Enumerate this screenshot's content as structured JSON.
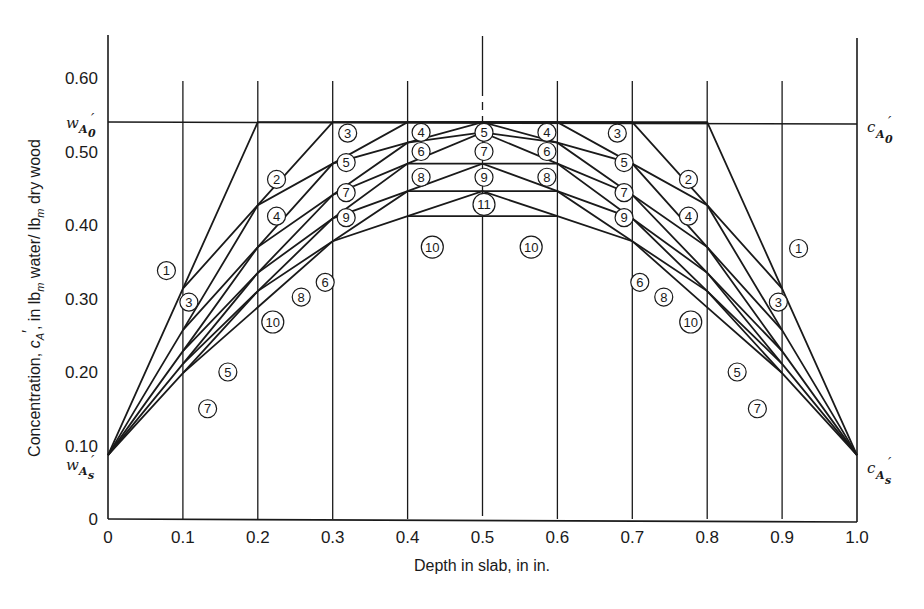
{
  "chart_data": {
    "type": "line",
    "title": "",
    "xlabel": "Depth in slab, in in.",
    "ylabel": "Concentration, c_A', in lb_m water/ lb_m dry wood",
    "xlim": [
      0,
      1.0
    ],
    "ylim": [
      0,
      0.65
    ],
    "x_ticks": [
      "0",
      "0.1",
      "0.2",
      "0.3",
      "0.4",
      "0.5",
      "0.6",
      "0.7",
      "0.8",
      "0.9",
      "1.0"
    ],
    "y_ticks": [
      "0",
      "0.10",
      "0.20",
      "0.30",
      "0.40",
      "0.50",
      "0.60"
    ],
    "grid": "vertical lines at each 0.1 in.",
    "initial_concentration": 0.54,
    "surface_concentration": 0.087,
    "annotations": {
      "left_top": "w_A0'",
      "left_bottom": "w_As'",
      "right_top": "c_A0'",
      "right_bottom": "c_As'"
    },
    "series": [
      {
        "name": "1",
        "x": [
          0,
          0.1,
          0.2,
          0.8,
          0.9,
          1.0
        ],
        "values": [
          0.087,
          0.3135,
          0.54,
          0.54,
          0.3135,
          0.087
        ]
      },
      {
        "name": "2",
        "x": [
          0.1,
          0.2,
          0.3,
          0.7,
          0.8,
          0.9
        ],
        "values": [
          0.3135,
          0.427,
          0.54,
          0.54,
          0.427,
          0.3135
        ]
      },
      {
        "name": "3",
        "x": [
          0,
          0.1,
          0.2,
          0.3,
          0.4,
          0.6,
          0.7,
          0.8,
          0.9,
          1.0
        ],
        "values": [
          0.087,
          0.257,
          0.427,
          0.4835,
          0.54,
          0.54,
          0.4835,
          0.427,
          0.257,
          0.087
        ]
      },
      {
        "name": "4",
        "x": [
          0.1,
          0.2,
          0.3,
          0.4,
          0.5,
          0.6,
          0.7,
          0.8,
          0.9
        ],
        "values": [
          0.257,
          0.37,
          0.4835,
          0.512,
          0.54,
          0.512,
          0.4835,
          0.37,
          0.257
        ]
      },
      {
        "name": "5",
        "x": [
          0,
          0.1,
          0.2,
          0.3,
          0.4,
          0.5,
          0.6,
          0.7,
          0.8,
          0.9,
          1.0
        ],
        "values": [
          0.087,
          0.2285,
          0.37,
          0.441,
          0.512,
          0.526,
          0.512,
          0.441,
          0.37,
          0.2285,
          0.087
        ]
      },
      {
        "name": "6",
        "x": [
          0.1,
          0.2,
          0.3,
          0.4,
          0.5,
          0.6,
          0.7,
          0.8,
          0.9
        ],
        "values": [
          0.2285,
          0.335,
          0.441,
          0.4835,
          0.526,
          0.4835,
          0.441,
          0.335,
          0.2285
        ]
      },
      {
        "name": "7",
        "x": [
          0,
          0.1,
          0.2,
          0.3,
          0.4,
          0.5,
          0.6,
          0.7,
          0.8,
          0.9,
          1.0
        ],
        "values": [
          0.087,
          0.211,
          0.335,
          0.409,
          0.4835,
          0.4835,
          0.4835,
          0.409,
          0.335,
          0.211,
          0.087
        ]
      },
      {
        "name": "8",
        "x": [
          0.1,
          0.2,
          0.3,
          0.4,
          0.5,
          0.6,
          0.7,
          0.8,
          0.9
        ],
        "values": [
          0.211,
          0.31,
          0.409,
          0.446,
          0.4835,
          0.446,
          0.409,
          0.31,
          0.211
        ]
      },
      {
        "name": "9",
        "x": [
          0,
          0.1,
          0.2,
          0.3,
          0.4,
          0.5,
          0.6,
          0.7,
          0.8,
          0.9,
          1.0
        ],
        "values": [
          0.087,
          0.1985,
          0.31,
          0.378,
          0.446,
          0.446,
          0.446,
          0.378,
          0.31,
          0.1985,
          0.087
        ]
      },
      {
        "name": "10",
        "x": [
          0.1,
          0.2,
          0.3,
          0.4,
          0.5,
          0.6,
          0.7,
          0.8,
          0.9
        ],
        "values": [
          0.1985,
          0.288,
          0.378,
          0.412,
          0.446,
          0.412,
          0.378,
          0.288,
          0.1985
        ]
      },
      {
        "name": "11",
        "x": [
          0.4,
          0.5,
          0.6
        ],
        "values": [
          0.412,
          0.412,
          0.412
        ]
      }
    ]
  },
  "labels": [
    {
      "text": "1",
      "x": 0.078,
      "y": 0.338
    },
    {
      "text": "1",
      "x": 0.922,
      "y": 0.368
    },
    {
      "text": "2",
      "x": 0.225,
      "y": 0.462
    },
    {
      "text": "2",
      "x": 0.775,
      "y": 0.462
    },
    {
      "text": "3",
      "x": 0.108,
      "y": 0.295
    },
    {
      "text": "3",
      "x": 0.32,
      "y": 0.525
    },
    {
      "text": "3",
      "x": 0.68,
      "y": 0.525
    },
    {
      "text": "3",
      "x": 0.895,
      "y": 0.295
    },
    {
      "text": "4",
      "x": 0.225,
      "y": 0.412
    },
    {
      "text": "4",
      "x": 0.418,
      "y": 0.526
    },
    {
      "text": "4",
      "x": 0.586,
      "y": 0.526
    },
    {
      "text": "4",
      "x": 0.775,
      "y": 0.412
    },
    {
      "text": "5",
      "x": 0.318,
      "y": 0.485
    },
    {
      "text": "5",
      "x": 0.502,
      "y": 0.526
    },
    {
      "text": "5",
      "x": 0.689,
      "y": 0.485
    },
    {
      "text": "5",
      "x": 0.16,
      "y": 0.2
    },
    {
      "text": "5",
      "x": 0.84,
      "y": 0.2
    },
    {
      "text": "6",
      "x": 0.418,
      "y": 0.5
    },
    {
      "text": "6",
      "x": 0.586,
      "y": 0.5
    },
    {
      "text": "6",
      "x": 0.29,
      "y": 0.322
    },
    {
      "text": "6",
      "x": 0.71,
      "y": 0.322
    },
    {
      "text": "7",
      "x": 0.318,
      "y": 0.444
    },
    {
      "text": "7",
      "x": 0.502,
      "y": 0.5
    },
    {
      "text": "7",
      "x": 0.689,
      "y": 0.444
    },
    {
      "text": "7",
      "x": 0.133,
      "y": 0.15
    },
    {
      "text": "7",
      "x": 0.867,
      "y": 0.15
    },
    {
      "text": "8",
      "x": 0.418,
      "y": 0.465
    },
    {
      "text": "8",
      "x": 0.586,
      "y": 0.465
    },
    {
      "text": "8",
      "x": 0.258,
      "y": 0.302
    },
    {
      "text": "8",
      "x": 0.742,
      "y": 0.302
    },
    {
      "text": "9",
      "x": 0.318,
      "y": 0.41
    },
    {
      "text": "9",
      "x": 0.502,
      "y": 0.465
    },
    {
      "text": "9",
      "x": 0.689,
      "y": 0.41
    },
    {
      "text": "10",
      "x": 0.433,
      "y": 0.37
    },
    {
      "text": "10",
      "x": 0.565,
      "y": 0.37
    },
    {
      "text": "10",
      "x": 0.22,
      "y": 0.268
    },
    {
      "text": "10",
      "x": 0.778,
      "y": 0.268
    },
    {
      "text": "11",
      "x": 0.502,
      "y": 0.428
    }
  ],
  "colors": {
    "ink": "#1a1a1a",
    "background": "#ffffff"
  }
}
